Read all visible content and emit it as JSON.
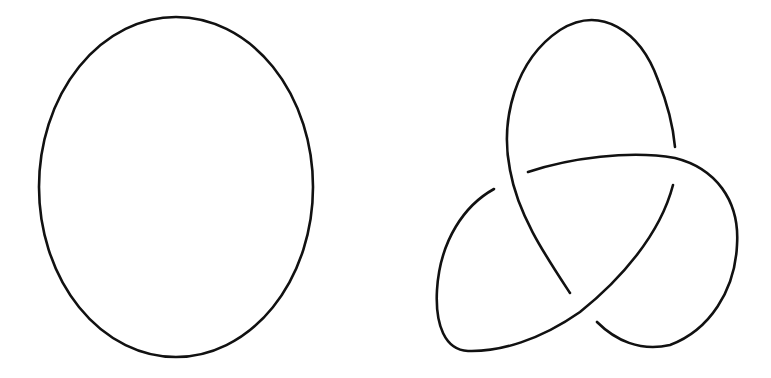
{
  "diagram": {
    "title": "",
    "background": "#ffffff",
    "stroke_color": "#111111",
    "figures": [
      {
        "id": "unknot",
        "shape": "ellipse",
        "center": [
          176,
          187
        ],
        "rx": 137,
        "ry": 170
      },
      {
        "id": "trefoil",
        "shape": "knot-diagram",
        "crossings": 3,
        "strands": [
          {
            "id": "top-lobe",
            "from": [
              570,
              293
            ],
            "to": [
              675,
              147
            ]
          },
          {
            "id": "right-lobe",
            "from": [
              528,
              172
            ],
            "to": [
              597,
              322
            ]
          },
          {
            "id": "left-lobe",
            "from": [
              673,
              185
            ],
            "to": [
              494,
              189
            ]
          }
        ]
      }
    ]
  }
}
